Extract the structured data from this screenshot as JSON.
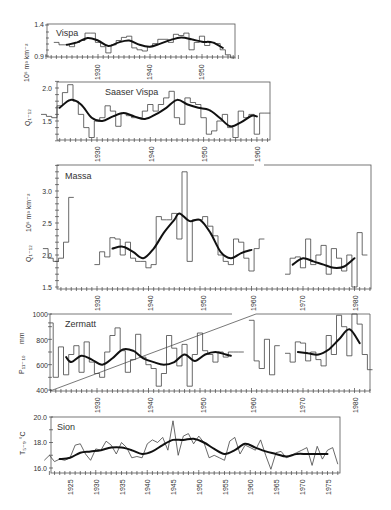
{
  "figure": {
    "panels": [
      {
        "id": "vispa",
        "title": "Vispa",
        "ylabel": "Q I-12  10^6 m^3 km^-2",
        "yticks": [
          "1.4",
          "0.9"
        ],
        "xticks": [
          "1930",
          "1940",
          "1950"
        ]
      },
      {
        "id": "saaser_vispa",
        "title": "Saaser Vispa",
        "ylabel": "Q I-12",
        "yticks": [
          "2.0",
          "1.5"
        ],
        "xticks": [
          "1930",
          "1940",
          "1950",
          "1960"
        ]
      },
      {
        "id": "massa",
        "title": "Massa",
        "ylabel": "Q I-12  10^6 m^3 km^-2",
        "yticks": [
          "3.0",
          "2.5",
          "2.0",
          "1.5"
        ],
        "xticks": [
          "1930",
          "1940",
          "1950",
          "1960",
          "1970",
          "1980"
        ]
      },
      {
        "id": "zermatt",
        "title": "Zermatt",
        "ylabel": "P 11-10  mm",
        "yticks": [
          "1000",
          "800",
          "600",
          "400"
        ],
        "xticks": [
          "1930",
          "1940",
          "1950",
          "1960",
          "1970",
          "1980"
        ]
      },
      {
        "id": "sion",
        "title": "Sion",
        "ylabel": "T 5-9 °C",
        "yticks": [
          "20.0",
          "18.0",
          "16.0"
        ],
        "xticks": [
          "1925",
          "1930",
          "1935",
          "1940",
          "1945",
          "1950",
          "1955",
          "1960",
          "1965",
          "1970",
          "1975"
        ]
      }
    ],
    "labels": {
      "vispa_title": "Vispa",
      "vispa_y_unit": "10⁶ m³ km⁻²",
      "saaser_title": "Saaser Vispa",
      "saaser_y_var": "Q₁₋₁₂",
      "massa_title": "Massa",
      "massa_y_var": "Q₁₋₁₂",
      "massa_y_unit": "10⁶ m³ km⁻²",
      "zermatt_title": "Zermatt",
      "zermatt_y_var": "P₁₁₋₁₀",
      "zermatt_y_unit": "mm",
      "sion_title": "Sion",
      "sion_y_var": "T₅₋₉ °C"
    }
  },
  "chart_data": [
    {
      "type": "line",
      "title": "Vispa",
      "xlabel": "",
      "ylabel": "Q I-12 (10^6 m^3 km^-2)",
      "ylim": [
        0.9,
        1.4
      ],
      "grid": false,
      "series": [
        {
          "name": "annual (step)",
          "x": [
            1922,
            1923,
            1924,
            1925,
            1926,
            1927,
            1928,
            1929,
            1930,
            1931,
            1932,
            1933,
            1934,
            1935,
            1936,
            1937,
            1938,
            1939,
            1940,
            1941,
            1942,
            1943,
            1944,
            1945,
            1946,
            1947,
            1948,
            1949,
            1950,
            1951,
            1952,
            1953,
            1954,
            1955,
            1956
          ],
          "values": [
            1.12,
            1.08,
            1.08,
            1.05,
            1.12,
            1.15,
            1.27,
            1.27,
            1.12,
            1.05,
            0.95,
            1.08,
            1.15,
            1.2,
            1.22,
            1.03,
            1.0,
            0.98,
            1.05,
            1.1,
            1.17,
            1.17,
            1.12,
            1.25,
            1.23,
            1.27,
            1.0,
            1.12,
            1.22,
            1.07,
            1.12,
            1.1,
            1.0,
            0.92,
            0.87
          ]
        },
        {
          "name": "smoothed",
          "x": [
            1924,
            1926,
            1928,
            1930,
            1932,
            1934,
            1936,
            1938,
            1940,
            1942,
            1944,
            1946,
            1948,
            1950,
            1952,
            1954
          ],
          "values": [
            1.08,
            1.12,
            1.19,
            1.15,
            1.06,
            1.12,
            1.15,
            1.08,
            1.05,
            1.1,
            1.16,
            1.2,
            1.17,
            1.13,
            1.12,
            1.03
          ]
        }
      ]
    },
    {
      "type": "line",
      "title": "Saaser Vispa",
      "xlabel": "",
      "ylabel": "Q I-12",
      "ylim": [
        1.2,
        2.1
      ],
      "grid": false,
      "series": [
        {
          "name": "annual (step)",
          "x": [
            1920,
            1921,
            1922,
            1923,
            1924,
            1925,
            1926,
            1927,
            1928,
            1929,
            1930,
            1931,
            1932,
            1933,
            1934,
            1935,
            1936,
            1937,
            1938,
            1939,
            1940,
            1941,
            1942,
            1943,
            1944,
            1945,
            1946,
            1947,
            1948,
            1949,
            1950,
            1951,
            1952,
            1953,
            1954,
            1955,
            1956,
            1957,
            1958,
            1959,
            1960,
            1961,
            1962
          ],
          "values": [
            1.6,
            1.57,
            1.55,
            1.73,
            1.93,
            2.05,
            1.8,
            1.6,
            1.4,
            1.25,
            1.5,
            1.55,
            1.73,
            1.65,
            1.42,
            1.62,
            1.58,
            1.55,
            1.55,
            1.65,
            1.75,
            1.65,
            1.75,
            1.85,
            1.95,
            1.55,
            1.45,
            1.85,
            1.78,
            1.75,
            1.55,
            1.3,
            1.35,
            1.5,
            1.6,
            1.4,
            1.25,
            1.65,
            1.55,
            1.6,
            1.3,
            1.62,
            1.62
          ]
        },
        {
          "name": "smoothed",
          "x": [
            1923,
            1925,
            1927,
            1929,
            1931,
            1933,
            1935,
            1937,
            1939,
            1941,
            1943,
            1945,
            1947,
            1949,
            1951,
            1953,
            1955,
            1957,
            1959,
            1960
          ],
          "values": [
            1.7,
            1.82,
            1.75,
            1.55,
            1.5,
            1.57,
            1.62,
            1.57,
            1.53,
            1.6,
            1.7,
            1.82,
            1.75,
            1.7,
            1.67,
            1.55,
            1.42,
            1.48,
            1.58,
            1.57
          ]
        }
      ]
    },
    {
      "type": "line",
      "title": "Massa",
      "xlabel": "",
      "ylabel": "Q I-12 (10^6 m^3 km^-2)",
      "ylim": [
        1.5,
        3.4
      ],
      "grid": false,
      "series": [
        {
          "name": "annual (step)",
          "x": [
            1920,
            1921,
            1922,
            1923,
            1924,
            1925,
            1930,
            1931,
            1932,
            1933,
            1934,
            1935,
            1936,
            1937,
            1938,
            1939,
            1940,
            1941,
            1942,
            1943,
            1944,
            1945,
            1946,
            1947,
            1948,
            1949,
            1950,
            1951,
            1952,
            1953,
            1954,
            1955,
            1956,
            1957,
            1958,
            1959,
            1960,
            1961,
            1962,
            1967,
            1968,
            1969,
            1970,
            1971,
            1972,
            1973,
            1974,
            1975,
            1976,
            1977,
            1978,
            1979,
            1980,
            1981,
            1982
          ],
          "values": [
            2.1,
            1.95,
            1.9,
            1.95,
            2.2,
            2.9,
            1.85,
            2.05,
            1.97,
            2.27,
            2.25,
            2.0,
            2.2,
            1.95,
            1.9,
            1.9,
            1.8,
            1.85,
            2.6,
            2.55,
            2.55,
            2.65,
            2.25,
            3.3,
            1.9,
            2.55,
            2.55,
            2.6,
            2.45,
            2.3,
            2.0,
            1.9,
            1.85,
            2.25,
            2.2,
            1.95,
            1.75,
            2.1,
            2.25,
            1.7,
            1.95,
            1.97,
            1.8,
            2.25,
            1.85,
            2.0,
            2.15,
            1.7,
            2.1,
            1.95,
            1.75,
            2.0,
            1.5,
            2.35,
            2.0
          ]
        },
        {
          "name": "smoothed",
          "x": [
            1933,
            1935,
            1937,
            1939,
            1941,
            1943,
            1945,
            1946,
            1948,
            1950,
            1952,
            1954,
            1956,
            1958,
            1960,
            1968,
            1970,
            1972,
            1974,
            1976,
            1978,
            1980
          ],
          "values": [
            2.1,
            2.13,
            2.05,
            1.95,
            2.1,
            2.35,
            2.55,
            2.65,
            2.53,
            2.55,
            2.35,
            2.05,
            1.95,
            2.03,
            2.08,
            1.85,
            1.95,
            1.9,
            1.85,
            1.8,
            1.82,
            1.95
          ]
        }
      ]
    },
    {
      "type": "line",
      "title": "Zermatt",
      "xlabel": "",
      "ylabel": "P 11-10 (mm)",
      "ylim": [
        400,
        1000
      ],
      "grid": false,
      "series": [
        {
          "name": "annual (step)",
          "x": [
            1921,
            1922,
            1923,
            1924,
            1925,
            1926,
            1927,
            1928,
            1929,
            1930,
            1931,
            1932,
            1933,
            1934,
            1935,
            1936,
            1937,
            1938,
            1939,
            1940,
            1941,
            1942,
            1943,
            1944,
            1945,
            1946,
            1947,
            1948,
            1949,
            1950,
            1951,
            1952,
            1953,
            1954,
            1955,
            1956,
            1957,
            1958,
            1960,
            1961,
            1962,
            1963,
            1964,
            1965,
            1967,
            1968,
            1969,
            1970,
            1971,
            1972,
            1973,
            1974,
            1975,
            1976,
            1977,
            1978,
            1979,
            1980,
            1981,
            1982,
            1983
          ],
          "values": [
            930,
            500,
            740,
            520,
            680,
            750,
            540,
            780,
            620,
            530,
            500,
            700,
            830,
            890,
            710,
            540,
            640,
            840,
            660,
            600,
            570,
            430,
            530,
            830,
            730,
            590,
            760,
            430,
            680,
            850,
            710,
            680,
            620,
            700,
            660,
            700,
            700,
            700,
            950,
            630,
            570,
            800,
            520,
            750,
            690,
            620,
            780,
            770,
            630,
            700,
            640,
            590,
            830,
            680,
            990,
            900,
            670,
            1000,
            920,
            680,
            560
          ]
        },
        {
          "name": "smoothed",
          "x": [
            1924,
            1925,
            1927,
            1929,
            1931,
            1933,
            1935,
            1937,
            1939,
            1941,
            1943,
            1945,
            1947,
            1949,
            1951,
            1953,
            1955,
            1956,
            1969,
            1971,
            1973,
            1975,
            1977,
            1979,
            1981
          ],
          "values": [
            660,
            620,
            670,
            640,
            600,
            650,
            720,
            710,
            650,
            620,
            600,
            620,
            680,
            630,
            680,
            700,
            680,
            670,
            700,
            690,
            680,
            720,
            800,
            880,
            770
          ]
        }
      ]
    },
    {
      "type": "line",
      "title": "Sion",
      "xlabel": "",
      "ylabel": "T 5-9 (°C)",
      "ylim": [
        16.0,
        20.0
      ],
      "grid": false,
      "series": [
        {
          "name": "annual",
          "x": [
            1920,
            1921,
            1922,
            1923,
            1924,
            1925,
            1926,
            1927,
            1928,
            1929,
            1930,
            1931,
            1932,
            1933,
            1934,
            1935,
            1936,
            1937,
            1938,
            1939,
            1940,
            1941,
            1942,
            1943,
            1944,
            1945,
            1946,
            1947,
            1948,
            1949,
            1950,
            1951,
            1952,
            1953,
            1954,
            1955,
            1956,
            1957,
            1958,
            1959,
            1960,
            1961,
            1962,
            1963,
            1964,
            1965,
            1966,
            1967,
            1968,
            1969,
            1970,
            1971,
            1972,
            1973,
            1974,
            1975,
            1976,
            1977
          ],
          "values": [
            16.6,
            17.0,
            16.5,
            16.7,
            16.6,
            16.8,
            17.8,
            17.9,
            17.1,
            16.6,
            17.5,
            17.4,
            18.1,
            17.8,
            17.1,
            18.0,
            17.6,
            16.8,
            16.9,
            16.8,
            17.9,
            18.2,
            18.0,
            18.4,
            17.4,
            19.7,
            17.0,
            18.5,
            18.7,
            17.9,
            18.5,
            18.0,
            16.8,
            17.0,
            16.8,
            16.6,
            18.1,
            18.4,
            17.1,
            17.8,
            17.6,
            17.4,
            18.2,
            17.0,
            15.9,
            17.2,
            17.3,
            16.8,
            17.0,
            17.2,
            17.4,
            17.6,
            16.2,
            17.7,
            16.7,
            17.4,
            17.6,
            16.3
          ]
        },
        {
          "name": "smoothed",
          "x": [
            1923,
            1925,
            1927,
            1929,
            1931,
            1933,
            1935,
            1937,
            1939,
            1941,
            1943,
            1945,
            1947,
            1949,
            1951,
            1953,
            1955,
            1957,
            1959,
            1961,
            1963,
            1965,
            1967,
            1969,
            1971,
            1973,
            1975
          ],
          "values": [
            16.7,
            16.8,
            17.2,
            17.3,
            17.4,
            17.6,
            17.6,
            17.4,
            17.1,
            17.3,
            17.8,
            18.2,
            18.2,
            18.3,
            18.0,
            17.5,
            17.1,
            17.4,
            17.9,
            17.6,
            17.3,
            17.1,
            16.9,
            17.1,
            17.1,
            17.1,
            17.1
          ]
        }
      ]
    }
  ]
}
